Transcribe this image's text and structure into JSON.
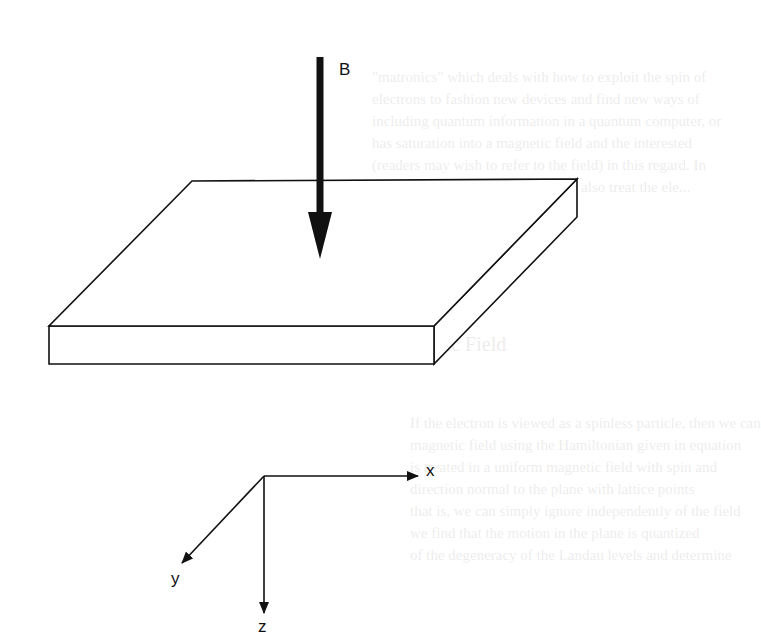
{
  "figure": {
    "field_label": "B",
    "axes": {
      "x_label": "x",
      "y_label": "y",
      "z_label": "z"
    },
    "colors": {
      "line": "#111111",
      "background": "#ffffff"
    }
  },
  "bleed_through_text": {
    "lines_top": [
      "\"matronics\" which deals with how to exploit the spin of",
      "electrons to fashion new devices and find new ways of",
      "including quantum information in a quantum computer, or",
      "has saturation into a magnetic field and the interested",
      "(readers may wish to refer to the field) in this regard. In",
      "in that some related topics, but we also treat the ele..."
    ],
    "heading": "7.3   The Spinless Electron in a Magnetic Field",
    "lines_bottom": [
      "If the electron is viewed as a spinless particle, then we can",
      "magnetic field using the Hamiltonian given in equation",
      "is treated in a uniform magnetic field with spin and",
      "direction normal to the plane with lattice points",
      "that is, we can simply ignore independently of the field",
      "we find that the motion in the plane is quantized",
      "of the degeneracy of the Landau levels and determine"
    ]
  }
}
